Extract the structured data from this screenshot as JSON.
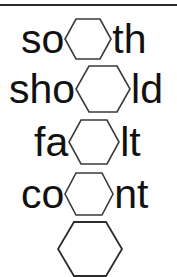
{
  "page": {
    "background_color": "#ffffff",
    "ink_color": "#111111",
    "hexagon_stroke_color": "#3a3a3a",
    "rule_color": "#2b2b2b",
    "width": 177,
    "height": 277
  },
  "divider": {
    "name": "top-horizontal-rule",
    "visible": true
  },
  "rows": [
    {
      "id": "row-1",
      "word": "so⬡th",
      "prefix": "so",
      "suffix": "th",
      "blank": "hexagon",
      "hex_width": 48,
      "hex_height": 42
    },
    {
      "id": "row-2",
      "word": "sho⬡ld",
      "prefix": "sho",
      "suffix": "ld",
      "blank": "hexagon",
      "hex_width": 56,
      "hex_height": 48
    },
    {
      "id": "row-3",
      "word": "fa⬡lt",
      "prefix": "fa",
      "suffix": "lt",
      "blank": "hexagon",
      "hex_width": 52,
      "hex_height": 46
    },
    {
      "id": "row-4",
      "word": "co⬡nt",
      "prefix": "co",
      "suffix": "nt",
      "blank": "hexagon",
      "hex_width": 50,
      "hex_height": 44
    }
  ],
  "bottom_shape": {
    "name": "large-hexagon",
    "shape": "hexagon",
    "width": 66,
    "height": 56,
    "filled": false
  }
}
